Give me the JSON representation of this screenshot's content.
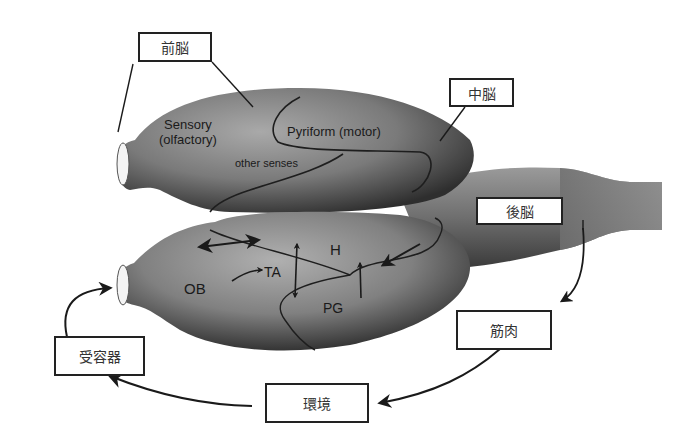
{
  "diagram": {
    "boxes": {
      "forebrain": "前脳",
      "midbrain": "中脳",
      "hindbrain": "後脳",
      "muscle": "筋肉",
      "environment": "環境",
      "receptor": "受容器"
    },
    "regions": {
      "sensory_line1": "Sensory",
      "sensory_line2": "(olfactory)",
      "pyriform": "Pyriform (motor)",
      "other_senses": "other senses",
      "ob": "OB",
      "ta": "TA",
      "h": "H",
      "pd": "PG"
    },
    "colors": {
      "background": "#ffffff",
      "box_border": "#222222",
      "brain_dark": "#2a2a2a",
      "brain_mid": "#6a6a6a",
      "brain_light": "#a8a8a8",
      "arrow": "#1a1a1a"
    }
  }
}
